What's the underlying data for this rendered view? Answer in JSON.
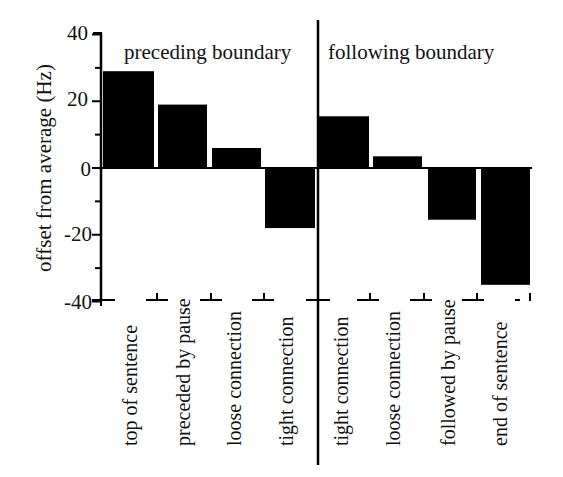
{
  "chart_data": {
    "type": "bar",
    "title": "",
    "xlabel": "",
    "ylabel": "offset from average (Hz)",
    "ylim": [
      -40,
      40
    ],
    "yticks": [
      40,
      20,
      0,
      -20,
      -40
    ],
    "yminor_step": 10,
    "grid": false,
    "legend": null,
    "groups": [
      {
        "name": "preceding boundary",
        "categories": [
          "top of sentence",
          "preceded by pause",
          "loose connection",
          "tight connection"
        ],
        "values": [
          29,
          19,
          6,
          -18
        ]
      },
      {
        "name": "following boundary",
        "categories": [
          "tight connection",
          "loose connection",
          "followed by pause",
          "end of sentence"
        ],
        "values": [
          15.5,
          3.5,
          -15.5,
          -35
        ]
      }
    ],
    "categories": [
      "top of sentence",
      "preceded by pause",
      "loose connection",
      "tight connection",
      "tight connection",
      "loose connection",
      "followed by pause",
      "end of sentence"
    ],
    "values": [
      29,
      19,
      6,
      -18,
      15.5,
      3.5,
      -15.5,
      -35
    ],
    "bar_color": "#000000"
  },
  "labels": {
    "ylabel": "offset from average (Hz)",
    "yticks": [
      "40",
      "20",
      "0",
      "-20",
      "-40"
    ],
    "group_left": "preceding boundary",
    "group_right": "following boundary",
    "cats": [
      "top of sentence",
      "preceded by pause",
      "loose connection",
      "tight connection",
      "tight connection",
      "loose connection",
      "followed by pause",
      "end of sentence"
    ]
  }
}
